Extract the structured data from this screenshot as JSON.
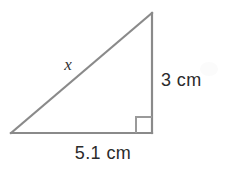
{
  "figure": {
    "type": "right-triangle-diagram",
    "background_color": "#ffffff",
    "stroke_color": "#8a8a8a",
    "text_color": "#2b2b2b",
    "canvas": {
      "width": 225,
      "height": 171
    },
    "vertices": {
      "bottom_left": {
        "x": 11,
        "y": 133
      },
      "bottom_right": {
        "x": 152,
        "y": 133
      },
      "apex": {
        "x": 152,
        "y": 13
      }
    },
    "right_angle_marker": {
      "at_vertex": "bottom_right",
      "size": 16,
      "name": "right-angle-square"
    },
    "labels": {
      "hypotenuse": "x",
      "vertical_leg": "3 cm",
      "base_leg": "5.1 cm"
    },
    "measurements": {
      "vertical_leg_value": 3,
      "vertical_leg_unit": "cm",
      "base_leg_value": 5.1,
      "base_leg_unit": "cm",
      "hypotenuse_value": "x",
      "unknown_side": "hypotenuse"
    }
  }
}
